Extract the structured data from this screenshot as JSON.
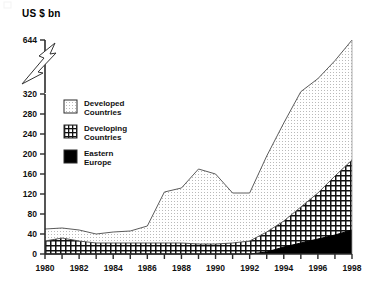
{
  "chart_data": {
    "type": "area",
    "stacked": true,
    "title": "",
    "ylabel": "US $ bn",
    "xlabel": "",
    "grid": false,
    "legend_position": "inside-upper-left",
    "axis_break": {
      "present": true,
      "style": "lightning-bolt",
      "below": 320,
      "above": 644
    },
    "ylim": [
      0,
      644
    ],
    "yticks": [
      0,
      40,
      80,
      120,
      160,
      200,
      240,
      280,
      320,
      644
    ],
    "yticklabels": [
      "0",
      "40",
      "80",
      "120",
      "160",
      "200",
      "240",
      "280",
      "320",
      "644"
    ],
    "xlim": [
      1980,
      1998
    ],
    "x": [
      1980,
      1981,
      1982,
      1983,
      1984,
      1985,
      1986,
      1987,
      1988,
      1989,
      1990,
      1991,
      1992,
      1993,
      1994,
      1995,
      1996,
      1997,
      1998
    ],
    "xticks": [
      1980,
      1981,
      1982,
      1983,
      1984,
      1985,
      1986,
      1987,
      1988,
      1989,
      1990,
      1991,
      1992,
      1993,
      1994,
      1995,
      1996,
      1997,
      1998
    ],
    "xticklabels": [
      "1980",
      "",
      "1982",
      "",
      "1984",
      "",
      "1986",
      "",
      "1988",
      "",
      "1990",
      "",
      "1992",
      "",
      "1994",
      "",
      "1996",
      "",
      "1998"
    ],
    "xticklabels_shown": [
      "1980",
      "1982",
      "1984",
      "1986",
      "1988",
      "1990",
      "1992",
      "1994",
      "1996",
      "1998"
    ],
    "series": [
      {
        "name": "Eastern Europe",
        "key": "eastern_europe",
        "fill": "solid-black",
        "color": "#000000",
        "values": [
          0,
          0,
          0,
          0,
          0,
          0,
          0,
          0,
          0,
          0,
          0,
          0,
          0,
          4,
          14,
          22,
          30,
          38,
          48
        ]
      },
      {
        "name": "Developing Countries",
        "key": "developing_countries",
        "fill": "grid-hatch",
        "color": "#1a1a1a",
        "values": [
          26,
          32,
          26,
          22,
          22,
          22,
          22,
          22,
          22,
          20,
          20,
          22,
          26,
          40,
          52,
          72,
          92,
          118,
          140
        ]
      },
      {
        "name": "Developed Countries",
        "key": "developed_countries",
        "fill": "light-dotted",
        "color": "#e8e8e8",
        "values": [
          24,
          20,
          22,
          18,
          22,
          24,
          34,
          102,
          110,
          150,
          140,
          100,
          96,
          152,
          196,
          240,
          290,
          364,
          456
        ]
      }
    ],
    "stack_totals": [
      50,
      52,
      48,
      40,
      44,
      46,
      56,
      124,
      132,
      170,
      160,
      122,
      122,
      196,
      262,
      334,
      412,
      520,
      644
    ],
    "annotations": []
  },
  "legend": {
    "items": [
      {
        "label_line1": "Developed",
        "label_line2": "Countries",
        "swatch": "light-dotted"
      },
      {
        "label_line1": "Developing",
        "label_line2": "Countries",
        "swatch": "grid-hatch"
      },
      {
        "label_line1": "Eastern",
        "label_line2": "Europe",
        "swatch": "solid-black"
      }
    ]
  },
  "colors": {
    "axis": "#2b2b2b",
    "ink": "#111111",
    "developed_fill": "#efefef",
    "developing_fill": "#ffffff",
    "eastern_fill": "#000000",
    "background": "#ffffff"
  }
}
